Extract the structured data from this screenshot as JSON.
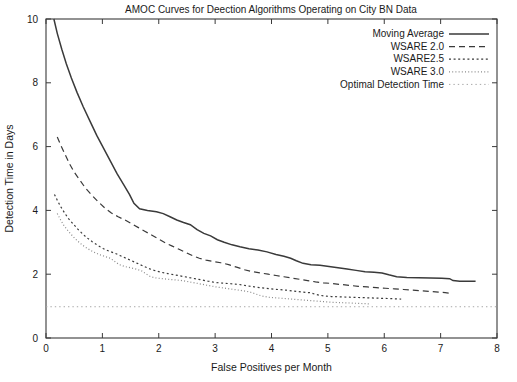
{
  "chart_data": {
    "type": "line",
    "title": "AMOC Curves for Deection Algorithms Operating on City BN Data",
    "xlabel": "False Positives per Month",
    "ylabel": "Detection Time in Days",
    "xlim": [
      0,
      8
    ],
    "ylim": [
      0,
      10
    ],
    "xticks": [
      0,
      1,
      2,
      3,
      4,
      5,
      6,
      7,
      8
    ],
    "yticks": [
      0,
      2,
      4,
      6,
      8,
      10
    ],
    "xtick_labels": [
      "0",
      "1",
      "2",
      "3",
      "4",
      "5",
      "6",
      "7",
      "8"
    ],
    "ytick_labels": [
      "0",
      "2",
      "4",
      "6",
      "8",
      "10"
    ],
    "grid": false,
    "legend_position": "top-right",
    "series": [
      {
        "name": "Moving Average",
        "dash": "none",
        "color": "#3a3a3a",
        "width": 1.5,
        "points": [
          [
            0.14,
            10.0
          ],
          [
            0.2,
            9.55
          ],
          [
            0.28,
            9.05
          ],
          [
            0.36,
            8.6
          ],
          [
            0.45,
            8.15
          ],
          [
            0.55,
            7.7
          ],
          [
            0.66,
            7.25
          ],
          [
            0.78,
            6.8
          ],
          [
            0.9,
            6.35
          ],
          [
            1.02,
            5.95
          ],
          [
            1.14,
            5.55
          ],
          [
            1.26,
            5.15
          ],
          [
            1.38,
            4.8
          ],
          [
            1.48,
            4.5
          ],
          [
            1.56,
            4.22
          ],
          [
            1.66,
            4.05
          ],
          [
            1.8,
            4.0
          ],
          [
            1.96,
            3.96
          ],
          [
            2.08,
            3.9
          ],
          [
            2.2,
            3.8
          ],
          [
            2.32,
            3.7
          ],
          [
            2.44,
            3.62
          ],
          [
            2.56,
            3.55
          ],
          [
            2.68,
            3.4
          ],
          [
            2.8,
            3.28
          ],
          [
            2.92,
            3.2
          ],
          [
            3.04,
            3.08
          ],
          [
            3.16,
            3.0
          ],
          [
            3.3,
            2.92
          ],
          [
            3.44,
            2.86
          ],
          [
            3.6,
            2.8
          ],
          [
            3.76,
            2.76
          ],
          [
            3.92,
            2.7
          ],
          [
            4.08,
            2.62
          ],
          [
            4.22,
            2.56
          ],
          [
            4.34,
            2.5
          ],
          [
            4.44,
            2.42
          ],
          [
            4.56,
            2.34
          ],
          [
            4.7,
            2.3
          ],
          [
            4.86,
            2.28
          ],
          [
            5.02,
            2.24
          ],
          [
            5.18,
            2.2
          ],
          [
            5.34,
            2.16
          ],
          [
            5.5,
            2.12
          ],
          [
            5.66,
            2.08
          ],
          [
            5.82,
            2.06
          ],
          [
            5.96,
            2.04
          ],
          [
            6.08,
            1.98
          ],
          [
            6.22,
            1.92
          ],
          [
            6.4,
            1.9
          ],
          [
            6.6,
            1.89
          ],
          [
            6.82,
            1.88
          ],
          [
            7.02,
            1.87
          ],
          [
            7.16,
            1.86
          ],
          [
            7.22,
            1.8
          ],
          [
            7.34,
            1.78
          ],
          [
            7.5,
            1.78
          ],
          [
            7.62,
            1.78
          ]
        ]
      },
      {
        "name": "WSARE 2.0",
        "dash": "6,4",
        "color": "#3a3a3a",
        "width": 1.2,
        "points": [
          [
            0.2,
            6.3
          ],
          [
            0.26,
            6.05
          ],
          [
            0.34,
            5.75
          ],
          [
            0.42,
            5.45
          ],
          [
            0.5,
            5.2
          ],
          [
            0.6,
            4.95
          ],
          [
            0.7,
            4.7
          ],
          [
            0.8,
            4.5
          ],
          [
            0.92,
            4.28
          ],
          [
            1.04,
            4.08
          ],
          [
            1.16,
            3.92
          ],
          [
            1.28,
            3.8
          ],
          [
            1.4,
            3.7
          ],
          [
            1.52,
            3.58
          ],
          [
            1.64,
            3.46
          ],
          [
            1.76,
            3.34
          ],
          [
            1.88,
            3.22
          ],
          [
            2.0,
            3.1
          ],
          [
            2.12,
            2.98
          ],
          [
            2.24,
            2.88
          ],
          [
            2.36,
            2.78
          ],
          [
            2.48,
            2.68
          ],
          [
            2.6,
            2.58
          ],
          [
            2.72,
            2.5
          ],
          [
            2.84,
            2.44
          ],
          [
            2.96,
            2.4
          ],
          [
            3.1,
            2.36
          ],
          [
            3.24,
            2.3
          ],
          [
            3.38,
            2.22
          ],
          [
            3.52,
            2.14
          ],
          [
            3.66,
            2.08
          ],
          [
            3.8,
            2.04
          ],
          [
            3.94,
            2.0
          ],
          [
            4.08,
            1.96
          ],
          [
            4.22,
            1.92
          ],
          [
            4.36,
            1.88
          ],
          [
            4.5,
            1.84
          ],
          [
            4.64,
            1.8
          ],
          [
            4.78,
            1.76
          ],
          [
            4.92,
            1.73
          ],
          [
            5.06,
            1.71
          ],
          [
            5.22,
            1.68
          ],
          [
            5.38,
            1.65
          ],
          [
            5.54,
            1.62
          ],
          [
            5.7,
            1.6
          ],
          [
            5.86,
            1.58
          ],
          [
            6.02,
            1.56
          ],
          [
            6.18,
            1.54
          ],
          [
            6.34,
            1.52
          ],
          [
            6.5,
            1.5
          ],
          [
            6.66,
            1.48
          ],
          [
            6.82,
            1.46
          ],
          [
            6.96,
            1.44
          ],
          [
            7.08,
            1.42
          ],
          [
            7.2,
            1.4
          ]
        ]
      },
      {
        "name": "WSARE2.5",
        "dash": "2,2.6",
        "color": "#3a3a3a",
        "width": 1.2,
        "points": [
          [
            0.15,
            4.5
          ],
          [
            0.2,
            4.32
          ],
          [
            0.26,
            4.12
          ],
          [
            0.33,
            3.92
          ],
          [
            0.4,
            3.74
          ],
          [
            0.48,
            3.58
          ],
          [
            0.56,
            3.42
          ],
          [
            0.64,
            3.28
          ],
          [
            0.72,
            3.15
          ],
          [
            0.82,
            3.02
          ],
          [
            0.92,
            2.9
          ],
          [
            1.02,
            2.8
          ],
          [
            1.12,
            2.72
          ],
          [
            1.22,
            2.66
          ],
          [
            1.32,
            2.58
          ],
          [
            1.42,
            2.5
          ],
          [
            1.52,
            2.42
          ],
          [
            1.62,
            2.34
          ],
          [
            1.72,
            2.26
          ],
          [
            1.82,
            2.18
          ],
          [
            1.92,
            2.12
          ],
          [
            2.04,
            2.06
          ],
          [
            2.16,
            2.02
          ],
          [
            2.28,
            1.98
          ],
          [
            2.4,
            1.94
          ],
          [
            2.52,
            1.9
          ],
          [
            2.64,
            1.86
          ],
          [
            2.76,
            1.82
          ],
          [
            2.88,
            1.78
          ],
          [
            3.0,
            1.74
          ],
          [
            3.14,
            1.72
          ],
          [
            3.28,
            1.7
          ],
          [
            3.42,
            1.68
          ],
          [
            3.56,
            1.64
          ],
          [
            3.7,
            1.6
          ],
          [
            3.84,
            1.57
          ],
          [
            3.98,
            1.54
          ],
          [
            4.12,
            1.52
          ],
          [
            4.26,
            1.5
          ],
          [
            4.4,
            1.47
          ],
          [
            4.54,
            1.44
          ],
          [
            4.68,
            1.42
          ],
          [
            4.8,
            1.36
          ],
          [
            4.92,
            1.32
          ],
          [
            5.06,
            1.3
          ],
          [
            5.22,
            1.29
          ],
          [
            5.38,
            1.28
          ],
          [
            5.54,
            1.27
          ],
          [
            5.7,
            1.26
          ],
          [
            5.86,
            1.25
          ],
          [
            6.02,
            1.24
          ],
          [
            6.18,
            1.23
          ],
          [
            6.3,
            1.22
          ]
        ]
      },
      {
        "name": "WSARE 3.0",
        "dash": "1,2.2",
        "color": "#8a8a8a",
        "width": 1.2,
        "points": [
          [
            0.2,
            3.9
          ],
          [
            0.26,
            3.7
          ],
          [
            0.32,
            3.52
          ],
          [
            0.4,
            3.34
          ],
          [
            0.48,
            3.18
          ],
          [
            0.56,
            3.04
          ],
          [
            0.64,
            2.92
          ],
          [
            0.74,
            2.8
          ],
          [
            0.84,
            2.7
          ],
          [
            0.94,
            2.62
          ],
          [
            1.04,
            2.56
          ],
          [
            1.14,
            2.5
          ],
          [
            1.22,
            2.4
          ],
          [
            1.3,
            2.3
          ],
          [
            1.4,
            2.24
          ],
          [
            1.5,
            2.2
          ],
          [
            1.6,
            2.16
          ],
          [
            1.7,
            2.1
          ],
          [
            1.78,
            2.0
          ],
          [
            1.86,
            1.92
          ],
          [
            1.96,
            1.88
          ],
          [
            2.06,
            1.86
          ],
          [
            2.18,
            1.84
          ],
          [
            2.3,
            1.82
          ],
          [
            2.42,
            1.8
          ],
          [
            2.54,
            1.76
          ],
          [
            2.66,
            1.72
          ],
          [
            2.78,
            1.68
          ],
          [
            2.9,
            1.64
          ],
          [
            3.02,
            1.6
          ],
          [
            3.14,
            1.57
          ],
          [
            3.26,
            1.54
          ],
          [
            3.38,
            1.51
          ],
          [
            3.5,
            1.48
          ],
          [
            3.62,
            1.44
          ],
          [
            3.72,
            1.38
          ],
          [
            3.82,
            1.32
          ],
          [
            3.94,
            1.28
          ],
          [
            4.08,
            1.26
          ],
          [
            4.22,
            1.24
          ],
          [
            4.36,
            1.22
          ],
          [
            4.5,
            1.2
          ],
          [
            4.64,
            1.18
          ],
          [
            4.78,
            1.16
          ],
          [
            4.92,
            1.14
          ],
          [
            5.06,
            1.12
          ],
          [
            5.2,
            1.11
          ],
          [
            5.34,
            1.1
          ],
          [
            5.48,
            1.09
          ],
          [
            5.62,
            1.08
          ],
          [
            5.74,
            1.07
          ]
        ]
      },
      {
        "name": "Optimal Detection Time",
        "dash": "1.4,3",
        "color": "#a8a8a8",
        "width": 1.0,
        "points": [
          [
            0.0,
            0.98
          ],
          [
            8.0,
            0.98
          ]
        ]
      }
    ]
  },
  "legend": {
    "items": [
      {
        "label": "Moving Average"
      },
      {
        "label": "WSARE 2.0"
      },
      {
        "label": "WSARE2.5"
      },
      {
        "label": "WSARE 3.0"
      },
      {
        "label": "Optimal Detection Time"
      }
    ]
  }
}
